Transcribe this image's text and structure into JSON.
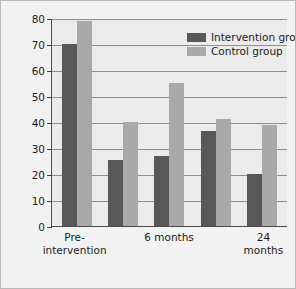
{
  "chart_data": {
    "type": "bar",
    "title": "",
    "xlabel": "",
    "ylabel": "Percentage with anxiety disorder",
    "ylim": [
      0,
      80
    ],
    "yticks": [
      0,
      10,
      20,
      30,
      40,
      50,
      60,
      70,
      80
    ],
    "grid": true,
    "legend_position": "top-right",
    "categories": [
      "Pre-\nintervention",
      "",
      "6 months",
      "",
      "24 months"
    ],
    "tick_labels": [
      "Pre-\nintervention",
      "6 months",
      "24 months"
    ],
    "series": [
      {
        "name": "Intervention group",
        "color": "#585858",
        "values": [
          70,
          25.5,
          27,
          36.5,
          20
        ]
      },
      {
        "name": "Control group",
        "color": "#a9a9a9",
        "values": [
          79,
          40,
          55,
          41,
          39
        ]
      }
    ]
  },
  "axis": {
    "y_title": "Percentage with anxiety disorder",
    "y_tick_labels": [
      "80",
      "70",
      "60",
      "50",
      "40",
      "30",
      "20",
      "10",
      "0"
    ],
    "x_tick_labels": [
      "Pre-\nintervention",
      "6 months",
      "24 months"
    ]
  },
  "legend": {
    "items": [
      {
        "label": "Intervention group",
        "color": "#585858"
      },
      {
        "label": "Control group",
        "color": "#a9a9a9"
      }
    ]
  },
  "colors": {
    "intervention": "#585858",
    "control": "#a9a9a9",
    "plot_background": "#ebebeb",
    "figure_background": "#f2f2f2",
    "axis": "#4a4a4a",
    "gridline": "#8d8d8d"
  }
}
